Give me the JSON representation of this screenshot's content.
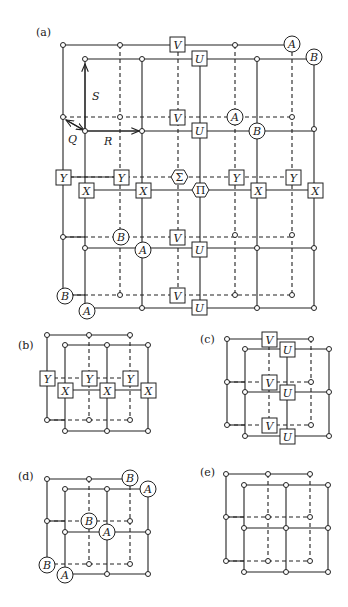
{
  "panels": [
    {
      "id": "a",
      "label": "(a)"
    },
    {
      "id": "b",
      "label": "(b)"
    },
    {
      "id": "c",
      "label": "(c)"
    },
    {
      "id": "d",
      "label": "(d)"
    },
    {
      "id": "e",
      "label": "(e)"
    }
  ],
  "vectors": {
    "S": "S",
    "Q": "Q",
    "R": "R"
  },
  "operators": {
    "X": "X",
    "Y": "Y",
    "U": "U",
    "V": "V",
    "A": "A",
    "B": "B",
    "Sigma": "Σ",
    "Pi": "Π"
  }
}
